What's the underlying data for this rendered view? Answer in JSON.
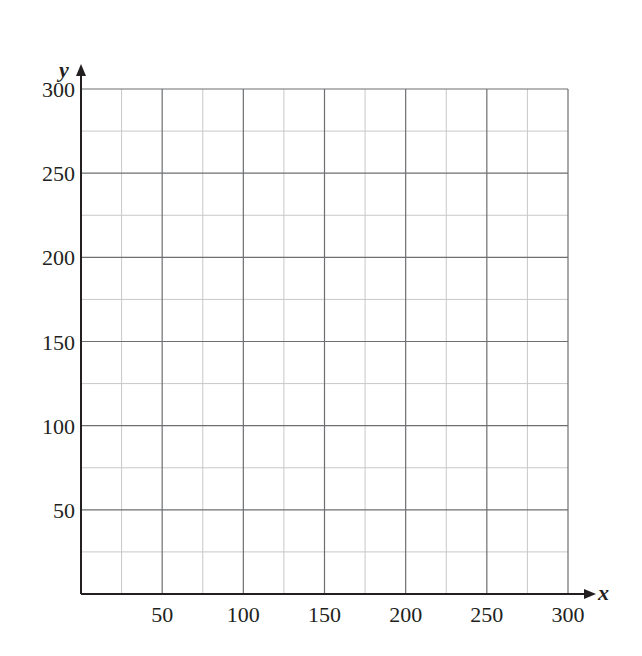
{
  "chart_data": {
    "type": "scatter",
    "title": "",
    "xlabel": "x",
    "ylabel": "y",
    "xlim": [
      0,
      300
    ],
    "ylim": [
      0,
      300
    ],
    "x_ticks": [
      50,
      100,
      150,
      200,
      250,
      300
    ],
    "y_ticks": [
      50,
      100,
      150,
      200,
      250,
      300
    ],
    "x_tick_labels": [
      "50",
      "100",
      "150",
      "200",
      "250",
      "300"
    ],
    "y_tick_labels": [
      "50",
      "100",
      "150",
      "200",
      "250",
      "300"
    ],
    "major_grid_step": 50,
    "minor_grid_step": 25,
    "grid": true,
    "series": [],
    "legend": null
  },
  "colors": {
    "axis": "#231f20",
    "major_grid": "#6d6e71",
    "minor_grid": "#c8c8c8",
    "text": "#231f20"
  },
  "layout": {
    "origin_px": [
      81,
      594
    ],
    "max_px": [
      568,
      89
    ]
  }
}
